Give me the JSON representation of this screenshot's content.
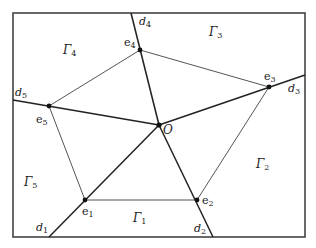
{
  "diagram": {
    "frame": {
      "x": 13,
      "y": 13,
      "width": 292,
      "height": 224,
      "stroke": "#444444"
    },
    "center": {
      "name": "O",
      "x": 159,
      "y": 125
    },
    "vertices": [
      {
        "name": "e",
        "sub": "1",
        "x": 85,
        "y": 200
      },
      {
        "name": "e",
        "sub": "2",
        "x": 197,
        "y": 200
      },
      {
        "name": "e",
        "sub": "3",
        "x": 269,
        "y": 87
      },
      {
        "name": "e",
        "sub": "4",
        "x": 140,
        "y": 50
      },
      {
        "name": "e",
        "sub": "5",
        "x": 49,
        "y": 106
      }
    ],
    "rays": [
      {
        "name": "d",
        "sub": "1",
        "x2": 49,
        "y2": 237
      },
      {
        "name": "d",
        "sub": "2",
        "x2": 213,
        "y2": 237
      },
      {
        "name": "d",
        "sub": "3",
        "x2": 305,
        "y2": 75
      },
      {
        "name": "d",
        "sub": "4",
        "x2": 131,
        "y2": 13
      },
      {
        "name": "d",
        "sub": "5",
        "x2": 13,
        "y2": 100
      }
    ],
    "regions": [
      {
        "name": "Γ",
        "sub": "1",
        "x": 133,
        "y": 222
      },
      {
        "name": "Γ",
        "sub": "2",
        "x": 256,
        "y": 168
      },
      {
        "name": "Γ",
        "sub": "3",
        "x": 209,
        "y": 36
      },
      {
        "name": "Γ",
        "sub": "4",
        "x": 63,
        "y": 54
      },
      {
        "name": "Γ",
        "sub": "5",
        "x": 24,
        "y": 186
      }
    ],
    "labels": {
      "O": {
        "text": "O",
        "x": 163,
        "y": 133
      },
      "e1": {
        "text": "e",
        "sub": "1",
        "x": 83,
        "y": 215
      },
      "e2": {
        "text": "e",
        "sub": "2",
        "x": 202,
        "y": 203
      },
      "e3": {
        "text": "e",
        "sub": "3",
        "x": 264,
        "y": 80
      },
      "e4": {
        "text": "e",
        "sub": "4",
        "x": 124,
        "y": 46
      },
      "e5": {
        "text": "e",
        "sub": "5",
        "x": 36,
        "y": 123
      },
      "d1": {
        "text": "d",
        "sub": "1",
        "x": 36,
        "y": 231
      },
      "d2": {
        "text": "d",
        "sub": "2",
        "x": 194,
        "y": 232
      },
      "d3": {
        "text": "d",
        "sub": "3",
        "x": 288,
        "y": 92
      },
      "d4": {
        "text": "d",
        "sub": "4",
        "x": 139,
        "y": 25
      },
      "d5": {
        "text": "d",
        "sub": "5",
        "x": 15,
        "y": 96
      }
    },
    "colors": {
      "thick_line": "#222222",
      "thin_line": "#555555",
      "point": "#111111"
    }
  }
}
